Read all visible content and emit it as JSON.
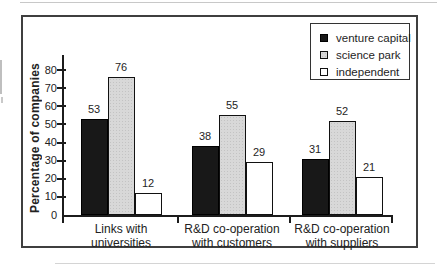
{
  "chart_data": {
    "type": "bar",
    "title": "",
    "xlabel": "",
    "ylabel": "Percentage of companies",
    "categories": [
      [
        "Links with",
        "universities"
      ],
      [
        "R&D co-operation",
        "with customers"
      ],
      [
        "R&D co-operation",
        "with suppliers"
      ]
    ],
    "series": [
      {
        "name": "venture capital",
        "values": [
          53,
          38,
          31
        ],
        "color": "#181818",
        "border": "#000000",
        "pattern": "solid"
      },
      {
        "name": "science park",
        "values": [
          76,
          55,
          52
        ],
        "color": "#d8d8d8",
        "border": "#111111",
        "pattern": "halftone-dots"
      },
      {
        "name": "independent",
        "values": [
          12,
          29,
          21
        ],
        "color": "#ffffff",
        "border": "#111111",
        "pattern": "solid"
      }
    ],
    "ylim": [
      0,
      80
    ],
    "ytick_step": 10,
    "yticks": [
      0,
      10,
      20,
      30,
      40,
      50,
      60,
      70,
      80
    ],
    "grid": false,
    "legend_position": "top-right",
    "bar_value_labels": true
  },
  "colors": {
    "frame_border": "#3f3f3f",
    "axis": "#1c1c1c",
    "text": "#222222",
    "background": "#ffffff"
  }
}
